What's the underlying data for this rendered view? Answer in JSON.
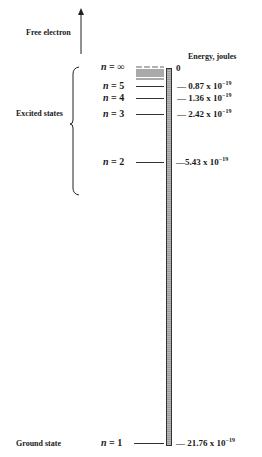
{
  "diagram": {
    "free_electron_label": "Free electron",
    "energy_axis_label": "Energy, joules",
    "excited_states_label": "Excited states",
    "ground_state_label": "Ground state",
    "levels": [
      {
        "n": "∞",
        "label_prefix": "n = ",
        "value": "0",
        "exp": ""
      },
      {
        "n": "5",
        "label_prefix": "n = ",
        "value": "— 0.87 x 10",
        "exp": "−19"
      },
      {
        "n": "4",
        "label_prefix": "n = ",
        "value": "— 1.36 x 10",
        "exp": "−19"
      },
      {
        "n": "3",
        "label_prefix": "n = ",
        "value": "— 2.42 x 10",
        "exp": "−19"
      },
      {
        "n": "2",
        "label_prefix": "n = ",
        "value": "—5.43 x 10",
        "exp": "−19"
      },
      {
        "n": "1",
        "label_prefix": "n = ",
        "value": "— 21.76 x 10",
        "exp": "−19"
      }
    ]
  }
}
